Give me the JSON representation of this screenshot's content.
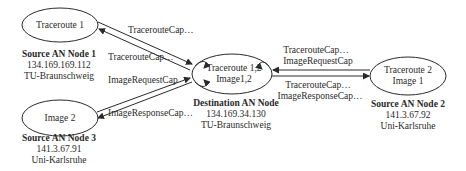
{
  "nodes": {
    "source1": {
      "ellipse_label": "Traceroute 1",
      "title": "Source AN Node 1",
      "ip": "134.169.169.112",
      "org": "TU-Braunschweig"
    },
    "source3": {
      "ellipse_label": "Image 2",
      "title": "Source AN Node 3",
      "ip": "141.3.67.91",
      "org": "Uni-Karlsruhe"
    },
    "destination": {
      "ellipse_line1": "Traceroute 1,2",
      "ellipse_line2": "Image1,2",
      "title": "Destination AN Node",
      "ip": "134.169.34.130",
      "org": "TU-Braunschweig"
    },
    "source2": {
      "ellipse_line1": "Traceroute 2",
      "ellipse_line2": "Image 1",
      "title": "Source AN Node 2",
      "ip": "141.3.67.92",
      "org": "Uni-Karlsruhe"
    }
  },
  "edges": {
    "s1_to_dest_label": "TracerouteCap…",
    "dest_to_s1_label": "TracerouteCap…",
    "s3_to_dest_label": "ImageRequestCap",
    "dest_to_s3_label": "ImageResponseCap…",
    "s2_to_dest_label_1": "TracerouteCap…",
    "s2_to_dest_label_2": "ImageRequestCap",
    "dest_to_s2_label_1": "TracerouteCap…",
    "dest_to_s2_label_2": "ImageResponseCap…"
  },
  "colors": {
    "stroke": "#2a2a2a",
    "background": "#ffffff"
  }
}
